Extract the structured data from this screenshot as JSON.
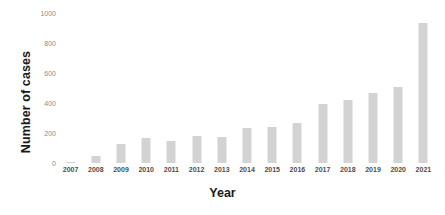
{
  "chart_data": {
    "type": "bar",
    "title": "",
    "xlabel": "Year",
    "ylabel": "Number of cases",
    "categories": [
      "2007",
      "2008",
      "2009",
      "2010",
      "2011",
      "2012",
      "2013",
      "2014",
      "2015",
      "2016",
      "2017",
      "2018",
      "2019",
      "2020",
      "2021"
    ],
    "values": [
      5,
      50,
      130,
      165,
      150,
      180,
      175,
      235,
      240,
      265,
      395,
      420,
      465,
      510,
      935
    ],
    "series": [
      {
        "name": "Number of cases",
        "values": [
          5,
          50,
          130,
          165,
          150,
          180,
          175,
          235,
          240,
          265,
          395,
          420,
          465,
          510,
          935
        ]
      }
    ],
    "ylim": [
      0,
      1000
    ],
    "yticks": [
      0,
      200,
      400,
      600,
      800,
      1000
    ],
    "ytick_labels": [
      "0",
      "200",
      "400",
      "600",
      "800",
      "1000"
    ],
    "grid": false,
    "legend": false,
    "legend_position": "none",
    "bar_color": "#d3d3d3",
    "axis_label_color": "#8c8c8c",
    "tick_label_color": "#4d4d4d",
    "title_color": "#1a1a1a",
    "background": "#ffffff"
  }
}
